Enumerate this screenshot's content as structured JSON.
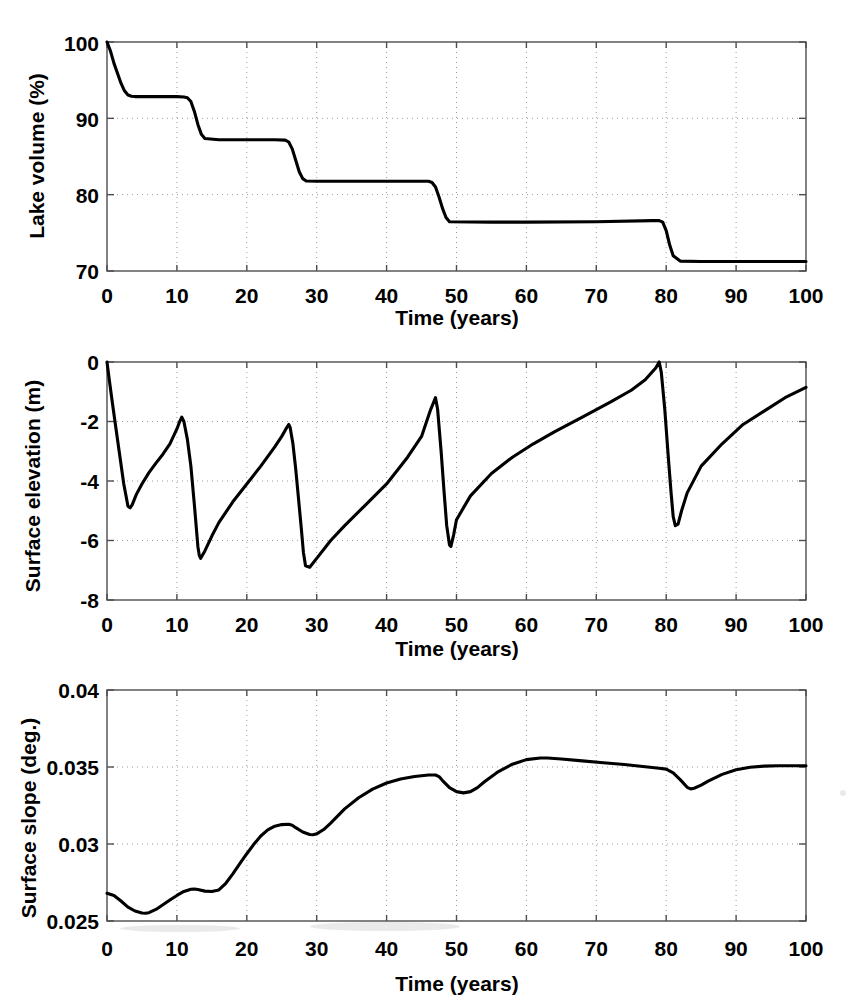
{
  "figure": {
    "background": "#ffffff",
    "line_color": "#000000",
    "axis_color": "#4d4d4d",
    "grid_color": "#9a9a9a"
  },
  "panels": [
    {
      "id": "lake-volume",
      "ylabel": "Lake volume (%)",
      "xlabel": "Time (years)",
      "ytick_labels": [
        "70",
        "80",
        "90",
        "100"
      ],
      "xtick_labels": [
        "0",
        "10",
        "20",
        "30",
        "40",
        "50",
        "60",
        "70",
        "80",
        "90",
        "100"
      ]
    },
    {
      "id": "surface-elevation",
      "ylabel": "Surface elevation (m)",
      "xlabel": "Time (years)",
      "ytick_labels": [
        "-8",
        "-6",
        "-4",
        "-2",
        "0"
      ],
      "xtick_labels": [
        "0",
        "10",
        "20",
        "30",
        "40",
        "50",
        "60",
        "70",
        "80",
        "90",
        "100"
      ]
    },
    {
      "id": "surface-slope",
      "ylabel": "Surface slope (deg.)",
      "xlabel": "Time (years)",
      "ytick_labels": [
        "0.025",
        "0.03",
        "0.035",
        "0.04"
      ],
      "xtick_labels": [
        "0",
        "10",
        "20",
        "30",
        "40",
        "50",
        "60",
        "70",
        "80",
        "90",
        "100"
      ]
    }
  ],
  "chart_data": [
    {
      "type": "line",
      "title": "",
      "xlabel": "Time (years)",
      "ylabel": "Lake volume (%)",
      "xlim": [
        0,
        100
      ],
      "ylim": [
        70,
        100
      ],
      "xticks": [
        0,
        10,
        20,
        30,
        40,
        50,
        60,
        70,
        80,
        90,
        100
      ],
      "yticks": [
        70,
        80,
        90,
        100
      ],
      "grid": true,
      "legend": null,
      "series": [
        {
          "name": "Lake volume",
          "x": [
            0,
            0.5,
            1,
            1.5,
            2,
            2.5,
            3,
            3.5,
            4,
            6,
            8,
            10,
            11,
            11.5,
            12,
            12.5,
            13,
            13.5,
            14,
            16,
            20,
            24,
            25.5,
            26,
            26.5,
            27,
            27.5,
            28,
            28.5,
            30,
            35,
            40,
            44,
            46,
            46.5,
            47,
            47.5,
            48,
            48.5,
            49,
            55,
            60,
            70,
            78,
            79,
            79.5,
            80,
            80.5,
            81,
            82,
            85,
            90,
            95,
            100
          ],
          "y": [
            100,
            98.8,
            97.2,
            95.9,
            94.6,
            93.6,
            93.05,
            92.9,
            92.85,
            92.85,
            92.85,
            92.85,
            92.8,
            92.7,
            92.2,
            90.9,
            89.2,
            87.9,
            87.35,
            87.2,
            87.2,
            87.2,
            87.15,
            86.9,
            86.0,
            84.5,
            83.0,
            82.1,
            81.8,
            81.75,
            81.75,
            81.75,
            81.75,
            81.75,
            81.6,
            81.0,
            79.7,
            78.2,
            77.0,
            76.45,
            76.4,
            76.4,
            76.45,
            76.6,
            76.6,
            76.4,
            75.3,
            73.4,
            72.0,
            71.3,
            71.25,
            71.25,
            71.25,
            71.25
          ]
        }
      ]
    },
    {
      "type": "line",
      "title": "",
      "xlabel": "Time (years)",
      "ylabel": "Surface elevation (m)",
      "xlim": [
        0,
        100
      ],
      "ylim": [
        -8,
        0
      ],
      "xticks": [
        0,
        10,
        20,
        30,
        40,
        50,
        60,
        70,
        80,
        90,
        100
      ],
      "yticks": [
        -8,
        -6,
        -4,
        -2,
        0
      ],
      "grid": true,
      "legend": null,
      "annotations": [
        "drainage events (rapid drops) at t = 13, 28, 49, 81 years",
        "recovery peaks at t = 10.7 (-1.85), 26 (-2.1), 47 (-1.2), 79 (0.0)"
      ],
      "series": [
        {
          "name": "Surface elevation",
          "x": [
            0,
            0.3,
            0.7,
            1.2,
            1.8,
            2.4,
            3.0,
            3.3,
            3.6,
            4.2,
            5,
            6,
            7,
            8,
            9,
            10,
            10.4,
            10.7,
            11,
            11.5,
            12,
            12.5,
            13,
            13.2,
            13.4,
            14,
            15,
            16,
            18,
            20,
            22,
            24,
            25,
            25.6,
            26,
            26.2,
            26.6,
            27,
            27.4,
            27.8,
            28.1,
            28.4,
            29,
            30,
            32,
            34,
            37,
            40,
            43,
            45,
            46.3,
            47,
            47.3,
            47.8,
            48.2,
            48.6,
            49,
            49.2,
            49.6,
            50,
            52,
            55,
            58,
            61,
            64,
            68,
            72,
            75,
            77,
            78.5,
            79,
            79.3,
            79.8,
            80.3,
            80.7,
            81,
            81.3,
            81.7,
            82.2,
            83,
            85,
            88,
            91,
            94,
            97,
            100
          ],
          "y": [
            0,
            -0.55,
            -1.25,
            -2.1,
            -3.1,
            -4.1,
            -4.85,
            -4.9,
            -4.8,
            -4.45,
            -4.1,
            -3.72,
            -3.4,
            -3.1,
            -2.75,
            -2.25,
            -2.0,
            -1.85,
            -2.0,
            -2.6,
            -3.5,
            -4.8,
            -6.2,
            -6.5,
            -6.6,
            -6.35,
            -5.85,
            -5.4,
            -4.7,
            -4.1,
            -3.5,
            -2.85,
            -2.5,
            -2.25,
            -2.1,
            -2.2,
            -2.75,
            -3.6,
            -4.6,
            -5.6,
            -6.4,
            -6.85,
            -6.9,
            -6.6,
            -6.0,
            -5.5,
            -4.8,
            -4.1,
            -3.2,
            -2.5,
            -1.6,
            -1.2,
            -1.6,
            -3.0,
            -4.3,
            -5.5,
            -6.15,
            -6.2,
            -5.8,
            -5.3,
            -4.5,
            -3.75,
            -3.2,
            -2.75,
            -2.35,
            -1.85,
            -1.35,
            -0.95,
            -0.6,
            -0.2,
            0.0,
            -0.35,
            -1.6,
            -3.2,
            -4.4,
            -5.2,
            -5.5,
            -5.45,
            -5.0,
            -4.4,
            -3.5,
            -2.75,
            -2.1,
            -1.65,
            -1.2,
            -0.85
          ]
        }
      ]
    },
    {
      "type": "line",
      "title": "",
      "xlabel": "Time (years)",
      "ylabel": "Surface slope (deg.)",
      "xlim": [
        0,
        100
      ],
      "ylim": [
        0.025,
        0.04
      ],
      "xticks": [
        0,
        10,
        20,
        30,
        40,
        50,
        60,
        70,
        80,
        90,
        100
      ],
      "yticks": [
        0.025,
        0.03,
        0.035,
        0.04
      ],
      "grid": true,
      "legend": null,
      "annotations": [
        "minimum 0.0255 near t = 5.5 years",
        "maximum 0.0356 near t = 62 years"
      ],
      "series": [
        {
          "name": "Surface slope",
          "x": [
            0,
            1,
            2,
            3,
            4,
            5,
            5.5,
            6,
            7,
            8,
            9,
            10,
            11,
            12,
            12.5,
            13,
            14,
            15,
            16,
            17,
            18,
            19,
            20,
            21,
            22,
            23,
            24,
            25,
            26,
            26.5,
            27,
            28,
            29,
            29.5,
            30,
            31,
            32,
            34,
            36,
            38,
            40,
            42,
            44,
            46,
            47,
            47.5,
            48,
            49,
            50,
            51,
            52,
            53,
            54,
            56,
            58,
            60,
            62,
            63,
            65,
            68,
            71,
            74,
            77,
            79,
            80,
            81,
            82,
            83,
            83.5,
            84,
            85,
            86,
            88,
            90,
            92,
            94,
            96,
            98,
            100
          ],
          "y": [
            0.0268,
            0.02665,
            0.0263,
            0.0259,
            0.02565,
            0.02552,
            0.0255,
            0.02554,
            0.02575,
            0.02605,
            0.02636,
            0.02666,
            0.02692,
            0.02706,
            0.02708,
            0.02704,
            0.02694,
            0.02692,
            0.02702,
            0.02745,
            0.02806,
            0.02872,
            0.02937,
            0.02998,
            0.03052,
            0.03092,
            0.03116,
            0.03126,
            0.03128,
            0.03122,
            0.03106,
            0.03078,
            0.03062,
            0.0306,
            0.03066,
            0.03094,
            0.03136,
            0.03228,
            0.033,
            0.03356,
            0.03396,
            0.03422,
            0.03438,
            0.03448,
            0.03448,
            0.03438,
            0.03412,
            0.03366,
            0.0334,
            0.03332,
            0.0334,
            0.03366,
            0.03404,
            0.0347,
            0.03518,
            0.03548,
            0.03558,
            0.03558,
            0.03552,
            0.0354,
            0.03528,
            0.03516,
            0.03502,
            0.03492,
            0.03486,
            0.03462,
            0.03418,
            0.03368,
            0.03358,
            0.03362,
            0.03382,
            0.03408,
            0.03452,
            0.03482,
            0.03498,
            0.03506,
            0.03508,
            0.03508,
            0.03508
          ]
        }
      ]
    }
  ]
}
